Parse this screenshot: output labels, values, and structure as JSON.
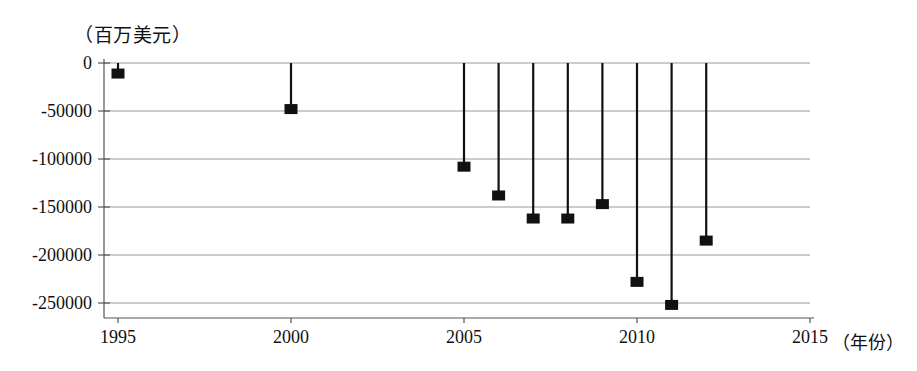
{
  "chart_data": {
    "type": "scatter",
    "title": "",
    "subtitle": "",
    "ylabel": "（百万美元）",
    "xlabel": "（年份）",
    "x": [
      1995,
      2000,
      2005,
      2006,
      2007,
      2008,
      2009,
      2010,
      2011,
      2012
    ],
    "values": [
      -11000,
      -48000,
      -108000,
      -138000,
      -162000,
      -162000,
      -147000,
      -228000,
      -252000,
      -185000
    ],
    "categories": [
      "1995",
      "2000",
      "2005",
      "2006",
      "2007",
      "2008",
      "2009",
      "2010",
      "2011",
      "2012"
    ],
    "series": [
      {
        "name": "",
        "values": [
          -11000,
          -48000,
          -108000,
          -138000,
          -162000,
          -162000,
          -147000,
          -228000,
          -252000,
          -185000
        ]
      }
    ],
    "xlim": [
      1995,
      2015
    ],
    "ylim": [
      -265000,
      0
    ],
    "xticks": [
      1995,
      2000,
      2005,
      2010,
      2015
    ],
    "xtick_labels": [
      "1995",
      "2000",
      "2005",
      "2010",
      "2015"
    ],
    "yticks": [
      0,
      -50000,
      -100000,
      -150000,
      -200000,
      -250000
    ],
    "ytick_labels": [
      "0",
      "-50000",
      "-100000",
      "-150000",
      "-200000",
      "-250000"
    ],
    "grid": "horizontal",
    "legend": "none",
    "marker": "square",
    "stem_from": 0,
    "colors": {
      "marker": "#111111",
      "stem": "#111111",
      "gridline": "#9a9a9a",
      "axis": "#555555"
    }
  },
  "axes": {
    "y_unit_label": "（百万美元）",
    "x_unit_label": "（年份）"
  }
}
